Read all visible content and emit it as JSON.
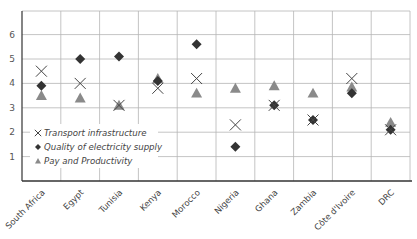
{
  "chart_data": {
    "type": "scatter",
    "title": "",
    "xlabel": "",
    "ylabel": "",
    "ylim": [
      0,
      7
    ],
    "yticks": [
      1,
      2,
      3,
      4,
      5,
      6
    ],
    "grid": true,
    "legend_position": "lower-left inside",
    "categories": [
      "South Africa",
      "Egypt",
      "Tunisia",
      "Kenya",
      "Morocco",
      "Nigeria",
      "Ghana",
      "Zambia",
      "Côte d'Ivoire",
      "DRC"
    ],
    "series": [
      {
        "name": "Transport infrastructure",
        "marker": "x",
        "color": "#444444",
        "values": [
          4.5,
          4.0,
          3.1,
          3.8,
          4.2,
          2.3,
          3.1,
          2.5,
          4.2,
          2.1
        ]
      },
      {
        "name": "Quality of electricity supply",
        "marker": "diamond",
        "color": "#333333",
        "values": [
          3.9,
          5.0,
          5.1,
          4.1,
          5.6,
          1.4,
          3.1,
          2.5,
          3.6,
          2.1
        ]
      },
      {
        "name": "Pay and Productivity",
        "marker": "triangle",
        "color": "#8a8a8a",
        "values": [
          3.5,
          3.4,
          3.1,
          4.2,
          3.6,
          3.8,
          3.9,
          3.6,
          3.85,
          2.4
        ]
      }
    ]
  },
  "legend": {
    "items": [
      {
        "symbol": "×",
        "label": "Transport infrastructure"
      },
      {
        "symbol": "◆",
        "label": "Quality of electricity supply"
      },
      {
        "symbol": "▲",
        "label": "Pay and Productivity"
      }
    ]
  },
  "colors": {
    "grid": "#b5b5b5",
    "axis": "#333333",
    "x_marker": "#444444",
    "diamond_marker": "#333333",
    "triangle_marker": "#8a8a8a"
  }
}
